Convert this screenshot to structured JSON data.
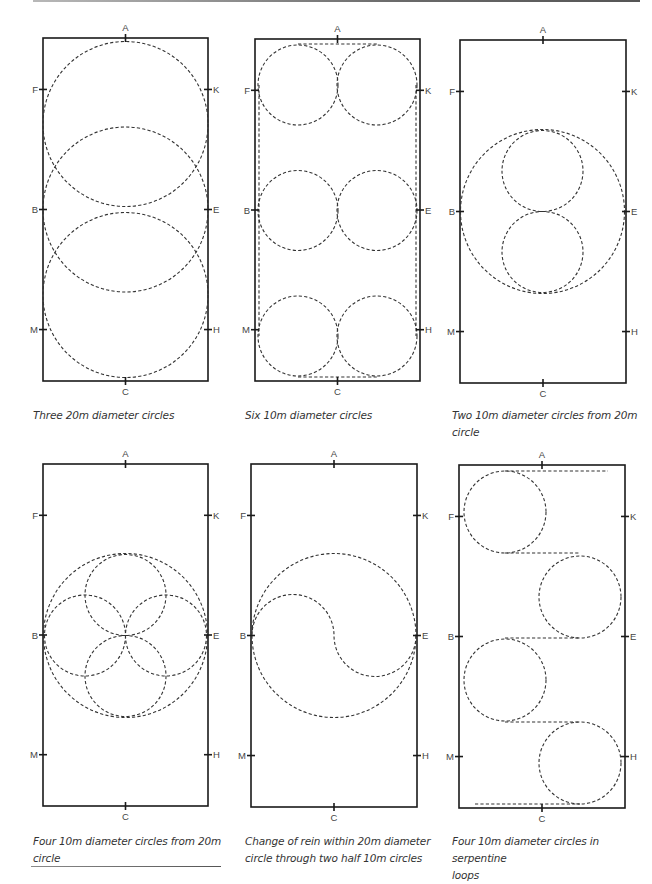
{
  "document": {
    "arena_markers": {
      "top": "A",
      "bottom": "C",
      "left": [
        "F",
        "B",
        "M"
      ],
      "right": [
        "K",
        "E",
        "H"
      ]
    },
    "arena_size_m": [
      20,
      40
    ],
    "line_color": "#1a1a1a",
    "dash_color": "#333333"
  },
  "figures": [
    {
      "id": "three-20m-circles",
      "caption": [
        "Three 20m diameter circles"
      ],
      "circles": [
        [
          82.5,
          86,
          82.5
        ],
        [
          82.5,
          171.5,
          82.5
        ],
        [
          82.5,
          257,
          82.5
        ]
      ],
      "lines": [],
      "paths": []
    },
    {
      "id": "six-10m-circles",
      "caption": [
        "Six 10m diameter circles"
      ],
      "circles": [
        [
          43,
          46,
          40
        ],
        [
          122,
          46,
          40
        ],
        [
          43,
          171.5,
          40
        ],
        [
          122,
          171.5,
          40
        ],
        [
          43,
          297,
          40
        ],
        [
          122,
          297,
          40
        ]
      ],
      "lines": [
        [
          43,
          5,
          122,
          5
        ],
        [
          43,
          338,
          122,
          338
        ],
        [
          4,
          46,
          4,
          297
        ],
        [
          161,
          46,
          161,
          297
        ]
      ],
      "paths": []
    },
    {
      "id": "two-10m-from-20m",
      "caption": [
        "Two 10m diameter circles from 20m circle"
      ],
      "circles": [
        [
          82.5,
          171.5,
          82
        ],
        [
          82.5,
          131,
          40.5
        ],
        [
          82.5,
          212,
          40.5
        ]
      ],
      "lines": [],
      "paths": []
    },
    {
      "id": "four-10m-from-20m",
      "caption": [
        "Four 10m diameter circles from 20m",
        "circle"
      ],
      "circles": [
        [
          82.5,
          171.5,
          82
        ],
        [
          82.5,
          131,
          40.5
        ],
        [
          82.5,
          212,
          40.5
        ],
        [
          42,
          171.5,
          40.5
        ],
        [
          123,
          171.5,
          40.5
        ]
      ],
      "lines": [],
      "paths": []
    },
    {
      "id": "change-of-rein-20m",
      "caption": [
        "Change of rein within 20m diameter",
        "circle through two half 10m circles"
      ],
      "circles": [
        [
          83,
          171.5,
          82
        ]
      ],
      "lines": [],
      "paths": [
        "M 1 171.5 A 41 41 0 0 1 83 171.5 A 41 41 0 0 0 165 171.5"
      ]
    },
    {
      "id": "serpentine-loops",
      "caption": [
        "Four 10m diameter circles in serpentine",
        "loops"
      ],
      "circles": [
        [
          46,
          47,
          41
        ],
        [
          121,
          132,
          41
        ],
        [
          46,
          215,
          41
        ],
        [
          121,
          298,
          41
        ]
      ],
      "lines": [
        [
          46,
          6,
          149,
          6
        ],
        [
          46,
          88,
          121,
          88
        ],
        [
          46,
          173,
          121,
          173
        ],
        [
          46,
          257,
          121,
          257
        ],
        [
          16,
          339,
          121,
          339
        ]
      ],
      "paths": []
    }
  ],
  "layout": {
    "arenas": [
      {
        "x": 43,
        "y": 38,
        "w": 165,
        "h": 343
      },
      {
        "x": 255,
        "y": 39,
        "w": 165,
        "h": 342
      },
      {
        "x": 460,
        "y": 40,
        "w": 166,
        "h": 343
      },
      {
        "x": 43,
        "y": 464,
        "w": 165,
        "h": 342
      },
      {
        "x": 251,
        "y": 464,
        "w": 166,
        "h": 343
      },
      {
        "x": 459,
        "y": 465,
        "w": 166,
        "h": 343
      }
    ],
    "captions": [
      {
        "x": 33,
        "y": 407
      },
      {
        "x": 245,
        "y": 407
      },
      {
        "x": 452,
        "y": 407
      },
      {
        "x": 33,
        "y": 833
      },
      {
        "x": 245,
        "y": 833
      },
      {
        "x": 452,
        "y": 833
      }
    ]
  }
}
